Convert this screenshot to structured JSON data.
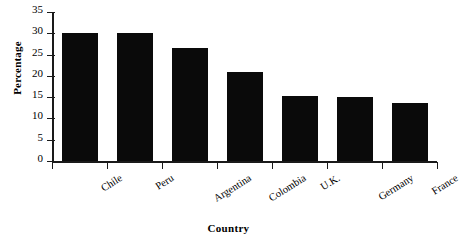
{
  "chart_data": {
    "type": "bar",
    "title": "",
    "xlabel": "Country",
    "ylabel": "Percentage",
    "categories": [
      "Chile",
      "Peru",
      "Argentina",
      "Colombia",
      "U.K.",
      "Germany",
      "France"
    ],
    "values": [
      30.0,
      30.0,
      26.6,
      21.0,
      15.3,
      15.1,
      13.7
    ],
    "ylim": [
      0,
      35
    ],
    "yticks": [
      0,
      5,
      10,
      15,
      20,
      25,
      30,
      35
    ],
    "ytick_labels": [
      "0",
      "5",
      "10",
      "15",
      "20",
      "25",
      "30",
      "35"
    ],
    "grid": false,
    "legend": false,
    "bar_color": "#0a0a0a",
    "axis_color": "#1a1a1a",
    "background": "#ffffff"
  }
}
